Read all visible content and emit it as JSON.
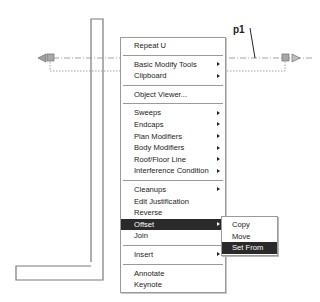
{
  "drawing": {
    "annotation_label": "p1"
  },
  "context_menu": {
    "items": [
      {
        "label": "Repeat U",
        "submenu": false
      },
      {
        "label": "Basic Modify Tools",
        "submenu": true
      },
      {
        "label": "Clipboard",
        "submenu": true
      },
      {
        "label": "Object Viewer...",
        "submenu": false
      },
      {
        "label": "Sweeps",
        "submenu": true
      },
      {
        "label": "Endcaps",
        "submenu": true
      },
      {
        "label": "Plan Modifiers",
        "submenu": true
      },
      {
        "label": "Body Modifiers",
        "submenu": true
      },
      {
        "label": "Roof/Floor Line",
        "submenu": true
      },
      {
        "label": "Interference Condition",
        "submenu": true
      },
      {
        "label": "Cleanups",
        "submenu": true
      },
      {
        "label": "Edit Justification",
        "submenu": false
      },
      {
        "label": "Reverse",
        "submenu": false
      },
      {
        "label": "Offset",
        "submenu": true,
        "active": true
      },
      {
        "label": "Join",
        "submenu": false
      },
      {
        "label": "Insert",
        "submenu": true
      },
      {
        "label": "Annotate",
        "submenu": false
      },
      {
        "label": "Keynote",
        "submenu": false
      }
    ]
  },
  "offset_submenu": {
    "items": [
      {
        "label": "Copy"
      },
      {
        "label": "Move"
      },
      {
        "label": "Set From",
        "active": true
      }
    ]
  },
  "colors": {
    "highlight": "#2a2a2a",
    "wall_line": "#7a7a7a",
    "grip": "#a0a0a0"
  }
}
